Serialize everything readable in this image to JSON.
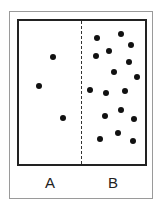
{
  "diagram": {
    "zones": [
      {
        "label": "A",
        "label_x": 50,
        "dots": [
          [
            53,
            57
          ],
          [
            39,
            86
          ],
          [
            63,
            118
          ]
        ]
      },
      {
        "label": "B",
        "label_x": 113,
        "dots": [
          [
            97,
            38
          ],
          [
            121,
            34
          ],
          [
            131,
            45
          ],
          [
            109,
            51
          ],
          [
            96,
            56
          ],
          [
            129,
            62
          ],
          [
            114,
            72
          ],
          [
            137,
            77
          ],
          [
            90,
            90
          ],
          [
            106,
            93
          ],
          [
            125,
            91
          ],
          [
            105,
            116
          ],
          [
            121,
            110
          ],
          [
            134,
            119
          ],
          [
            100,
            139
          ],
          [
            118,
            133
          ],
          [
            133,
            141
          ]
        ]
      }
    ],
    "dot_color": "#111111"
  }
}
